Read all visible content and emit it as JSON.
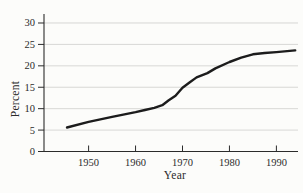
{
  "figure": {
    "width": 303,
    "height": 193,
    "background": "#fcfcfa"
  },
  "chart_data": {
    "type": "line",
    "title": "",
    "xlabel": "Year",
    "ylabel": "Percent",
    "x": [
      1945.4,
      1950,
      1955,
      1960,
      1962,
      1964,
      1965.7,
      1967,
      1968.5,
      1970,
      1971.5,
      1973,
      1975.3,
      1977,
      1980,
      1982.5,
      1985,
      1987.5,
      1990,
      1994
    ],
    "series": [
      {
        "name": "percent",
        "color": "#1c1c1c",
        "stroke_width": 2.4,
        "values": [
          5.6,
          6.9,
          8.1,
          9.2,
          9.7,
          10.2,
          10.8,
          11.9,
          13.0,
          14.9,
          16.1,
          17.3,
          18.3,
          19.4,
          20.9,
          21.9,
          22.7,
          23.0,
          23.2,
          23.6
        ]
      }
    ],
    "xticks": [
      1950,
      1960,
      1970,
      1980,
      1990
    ],
    "yticks": [
      0,
      5,
      10,
      15,
      20,
      25,
      30
    ],
    "xlim": [
      1940.5,
      1994.6
    ],
    "ylim": [
      0,
      32.1
    ],
    "grid": "horizontal",
    "grid_color": "#d4d4d1",
    "axis_color": "#2b2b2b",
    "tick_label_color": "#2b2b2b",
    "tick_label_size": 10.5,
    "legend": "none"
  }
}
